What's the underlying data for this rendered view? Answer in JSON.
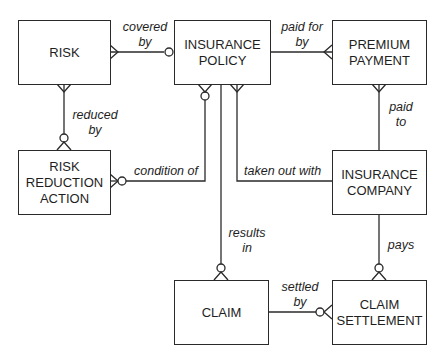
{
  "diagram": {
    "type": "entity-relationship",
    "entities": [
      {
        "id": "risk",
        "label": "RISK"
      },
      {
        "id": "insurance_policy",
        "label": "INSURANCE\nPOLICY"
      },
      {
        "id": "premium_payment",
        "label": "PREMIUM\nPAYMENT"
      },
      {
        "id": "risk_reduction_action",
        "label": "RISK\nREDUCTION\nACTION"
      },
      {
        "id": "insurance_company",
        "label": "INSURANCE\nCOMPANY"
      },
      {
        "id": "claim",
        "label": "CLAIM"
      },
      {
        "id": "claim_settlement",
        "label": "CLAIM\nSETTLEMENT"
      }
    ],
    "relationships": [
      {
        "label": "covered\nby",
        "from": "risk",
        "to": "insurance_policy"
      },
      {
        "label": "paid for\nby",
        "from": "insurance_policy",
        "to": "premium_payment"
      },
      {
        "label": "reduced\nby",
        "from": "risk",
        "to": "risk_reduction_action"
      },
      {
        "label": "paid\nto",
        "from": "premium_payment",
        "to": "insurance_company"
      },
      {
        "label": "condition of",
        "from": "risk_reduction_action",
        "to": "insurance_policy"
      },
      {
        "label": "taken out with",
        "from": "insurance_policy",
        "to": "insurance_company"
      },
      {
        "label": "results\nin",
        "from": "insurance_policy",
        "to": "claim"
      },
      {
        "label": "pays",
        "from": "insurance_company",
        "to": "claim_settlement"
      },
      {
        "label": "settled\nby",
        "from": "claim",
        "to": "claim_settlement"
      }
    ]
  }
}
